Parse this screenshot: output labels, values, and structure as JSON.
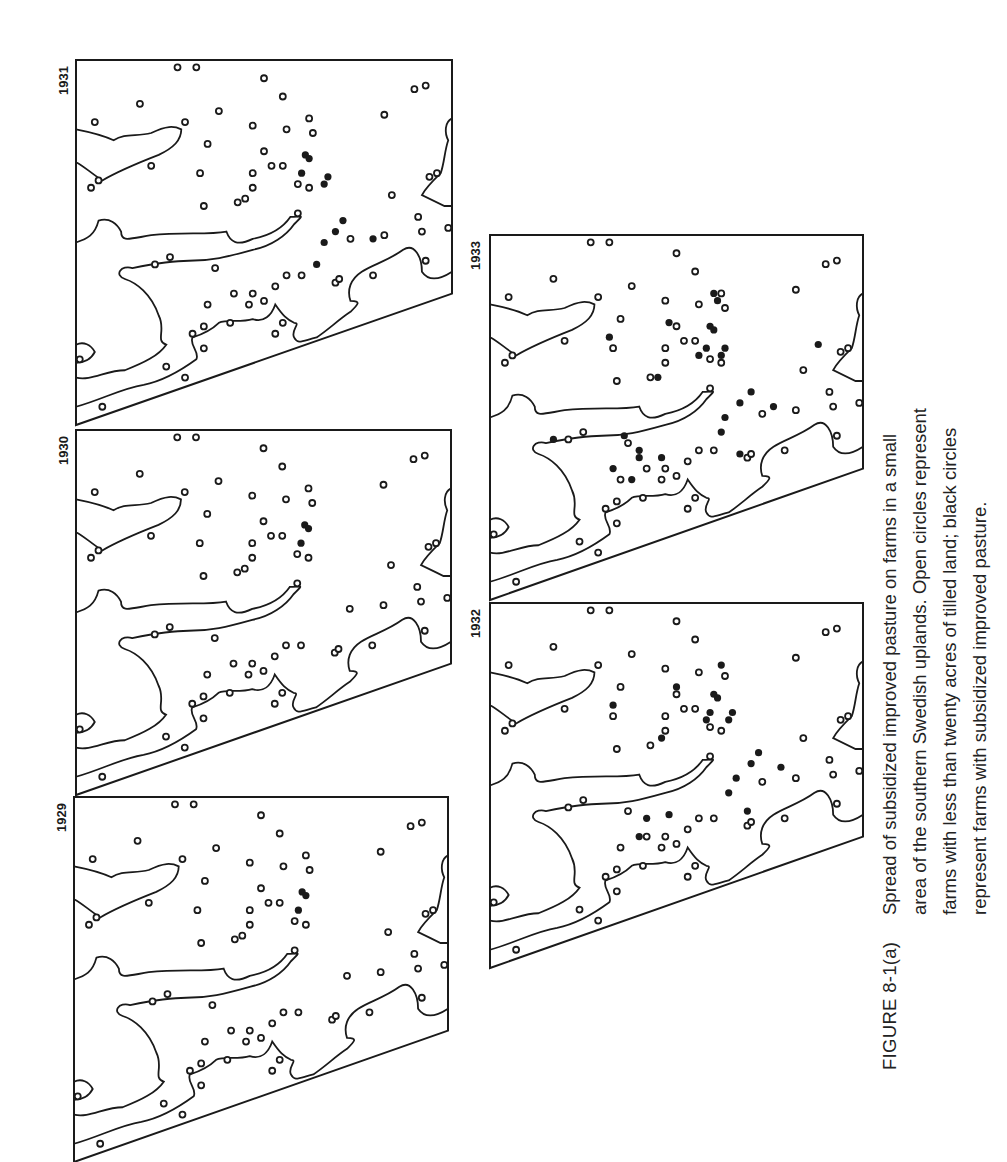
{
  "figure": {
    "label": "FIGURE 8-1(a)",
    "caption_lines": [
      "Spread of subsidized improved pasture on farms in a small",
      "area of the southern Swedish uplands. Open circles represent",
      "farms with less than twenty acres of tilled land; black circles",
      "represent farms with subsidized improved pasture."
    ],
    "legend": {
      "open_circle": "farms with less than twenty acres of tilled land",
      "black_circle": "farms with subsidized improved pasture"
    }
  },
  "panels": [
    {
      "id": "p1931",
      "year": "1931",
      "adopters_approx": 9
    },
    {
      "id": "p1930",
      "year": "1930",
      "adopters_approx": 3
    },
    {
      "id": "p1929",
      "year": "1929",
      "adopters_approx": 3
    },
    {
      "id": "p1933",
      "year": "1933",
      "adopters_approx": 24
    },
    {
      "id": "p1932",
      "year": "1932",
      "adopters_approx": 19
    }
  ],
  "colors": {
    "ink": "#1a1a1a",
    "paper": "#ffffff"
  }
}
